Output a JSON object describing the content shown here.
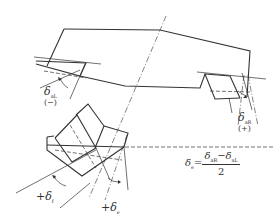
{
  "diagram": {
    "type": "wheel-toe-angle-schematic",
    "labels": {
      "left_toe": {
        "symbol": "δ",
        "subscript": "aL",
        "sign": "(−)"
      },
      "right_toe": {
        "symbol": "δ",
        "subscript": "aR",
        "sign": "(+)"
      },
      "front_left": {
        "prefix": "+",
        "symbol": "δ",
        "subscript": "f"
      },
      "front_right": {
        "prefix": "+",
        "symbol": "δ",
        "subscript": "e"
      }
    },
    "formula": {
      "lhs_symbol": "δ",
      "lhs_subscript": "e",
      "equals": "=",
      "numerator": "δaR−δaL",
      "numerator_parts": [
        {
          "symbol": "δ",
          "subscript": "aR"
        },
        {
          "op": "−"
        },
        {
          "symbol": "δ",
          "subscript": "aL"
        }
      ],
      "denominator": "2"
    },
    "colors": {
      "stroke": "#333333",
      "background": "#ffffff"
    }
  }
}
